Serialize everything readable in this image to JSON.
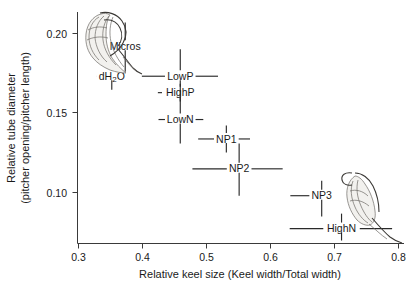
{
  "chart_data": {
    "type": "scatter",
    "title": "",
    "xlabel": "Relative keel size (Keel width/Total width)",
    "ylabel_line1": "Relative tube diameter",
    "ylabel_line2": "(pitcher opening/pitcher length)",
    "xlim": [
      0.3,
      0.8
    ],
    "ylim": [
      0.06,
      0.215
    ],
    "xticks": [
      0.3,
      0.4,
      0.5,
      0.6,
      0.7,
      0.8
    ],
    "xtick_labels": [
      "0.3",
      "0.4",
      "0.5",
      "0.6",
      "0.7",
      "0.8"
    ],
    "yticks": [
      0.1,
      0.15,
      0.2
    ],
    "ytick_labels": [
      "0.10",
      "0.15",
      "0.20"
    ],
    "grid": false,
    "legend": "none",
    "error_bars": "both",
    "points": [
      {
        "label": "Micros",
        "x": 0.373,
        "y": 0.192,
        "x_err_low": 0.373,
        "x_err_high": 0.396,
        "y_err_low": 0.175,
        "y_err_high": 0.208,
        "label_side": "left"
      },
      {
        "label": "dH2O",
        "label_display": "dH₂O",
        "x": 0.352,
        "y": 0.172,
        "x_err_low": 0.328,
        "x_err_high": 0.352,
        "y_err_low": 0.163,
        "y_err_high": 0.183,
        "label_side": "center"
      },
      {
        "label": "LowP",
        "x": 0.459,
        "y": 0.172,
        "x_err_low": 0.399,
        "x_err_high": 0.518,
        "y_err_low": 0.159,
        "y_err_high": 0.19,
        "label_side": "center"
      },
      {
        "label": "HighP",
        "x": 0.459,
        "y": 0.161,
        "x_err_low": 0.424,
        "x_err_high": 0.473,
        "y_err_low": 0.155,
        "y_err_high": 0.167,
        "label_side": "center"
      },
      {
        "label": "LowN",
        "x": 0.459,
        "y": 0.143,
        "x_err_low": 0.425,
        "x_err_high": 0.495,
        "y_err_low": 0.127,
        "y_err_high": 0.16,
        "label_side": "center"
      },
      {
        "label": "NP1",
        "x": 0.531,
        "y": 0.13,
        "x_err_low": 0.487,
        "x_err_high": 0.568,
        "y_err_low": 0.121,
        "y_err_high": 0.139,
        "label_side": "center"
      },
      {
        "label": "NP2",
        "x": 0.551,
        "y": 0.11,
        "x_err_low": 0.478,
        "x_err_high": 0.619,
        "y_err_low": 0.092,
        "y_err_high": 0.127,
        "label_side": "center"
      },
      {
        "label": "NP3",
        "x": 0.68,
        "y": 0.092,
        "x_err_low": 0.631,
        "x_err_high": 0.697,
        "y_err_low": 0.078,
        "y_err_high": 0.102,
        "label_side": "center"
      },
      {
        "label": "HighN",
        "x": 0.711,
        "y": 0.07,
        "x_err_low": 0.63,
        "x_err_high": 0.79,
        "y_err_low": 0.062,
        "y_err_high": 0.08,
        "label_side": "center"
      }
    ],
    "annotations": [
      {
        "name": "broad-pitcher-illustration",
        "description": "broad squat pitcher drawing near Micros/dH2O"
      },
      {
        "name": "slender-pitcher-illustration",
        "description": "narrow elongated pitcher drawing near NP3/HighN"
      }
    ]
  }
}
